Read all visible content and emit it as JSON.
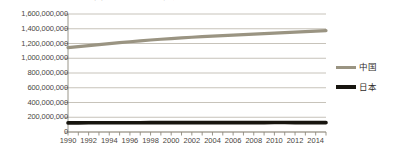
{
  "chart_data": {
    "type": "line",
    "title": "中国と日本の人口推移（1990-2015）",
    "title_clipped": true,
    "xlabel": "",
    "ylabel": "",
    "grid": true,
    "legend_position": "right",
    "xlim": [
      1990,
      2015
    ],
    "ylim": [
      0,
      1600000000
    ],
    "x": [
      1990,
      1991,
      1992,
      1993,
      1994,
      1995,
      1996,
      1997,
      1998,
      1999,
      2000,
      2001,
      2002,
      2003,
      2004,
      2005,
      2006,
      2007,
      2008,
      2009,
      2010,
      2011,
      2012,
      2013,
      2014,
      2015
    ],
    "xtick_labels": [
      "1990",
      "1992",
      "1994",
      "1996",
      "1998",
      "2000",
      "2002",
      "2004",
      "2006",
      "2008",
      "2010",
      "2012",
      "2014"
    ],
    "xtick_values": [
      1990,
      1992,
      1994,
      1996,
      1998,
      2000,
      2002,
      2004,
      2006,
      2008,
      2010,
      2012,
      2014
    ],
    "ytick_labels": [
      "1,600,000,000",
      "1,400,000,000",
      "1,200,000,000",
      "1,000,000,000",
      "800,000,000",
      "600,000,000",
      "400,000,000",
      "200,000,000",
      "0"
    ],
    "ytick_values": [
      1600000000,
      1400000000,
      1200000000,
      1000000000,
      800000000,
      600000000,
      400000000,
      200000000,
      0
    ],
    "series": [
      {
        "name": "中国",
        "color": "#9a9482",
        "width": 3.2,
        "values": [
          1143330000,
          1158230000,
          1171710000,
          1185170000,
          1198500000,
          1211210000,
          1223890000,
          1236260000,
          1247610000,
          1257860000,
          1267430000,
          1276270000,
          1284530000,
          1292270000,
          1299880000,
          1307560000,
          1314480000,
          1321290000,
          1328020000,
          1334500000,
          1340910000,
          1347350000,
          1354040000,
          1360720000,
          1367820000,
          1374620000
        ]
      },
      {
        "name": "日本",
        "color": "#17150f",
        "width": 3.6,
        "values": [
          123540000,
          124040000,
          124450000,
          124760000,
          125030000,
          125570000,
          125860000,
          126160000,
          126470000,
          126670000,
          126840000,
          127150000,
          127450000,
          127720000,
          127760000,
          127770000,
          127760000,
          127770000,
          127690000,
          127510000,
          128060000,
          127820000,
          127560000,
          127300000,
          127130000,
          127090000
        ]
      }
    ],
    "colors": {
      "china_line": "#9a9482",
      "japan_line": "#17150f",
      "gridline": "#b9b4a8",
      "axis": "#8f8a7e",
      "background": "#ffffff",
      "text": "#4a453e"
    }
  }
}
